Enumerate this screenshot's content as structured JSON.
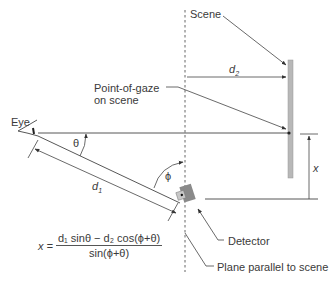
{
  "diagram": {
    "labels": {
      "scene": "Scene",
      "point_of_gaze_line1": "Point-of-gaze",
      "point_of_gaze_line2": "on scene",
      "eye": "Eye",
      "theta": "θ",
      "phi": "ϕ",
      "d1": "d",
      "d1_sub": "1",
      "d2": "d",
      "d2_sub": "2",
      "x": "x",
      "detector": "Detector",
      "plane": "Plane parallel to scene"
    },
    "formula": {
      "lhs": "x =",
      "numerator": "d₁ sinθ − d₂ cos(ϕ+θ)",
      "denominator": "sin(ϕ+θ)"
    },
    "colors": {
      "line": "#444444",
      "scene_bar": "#b8b8b8",
      "detector_dark": "#8a8a8a",
      "detector_light": "#c8c8c8"
    }
  }
}
